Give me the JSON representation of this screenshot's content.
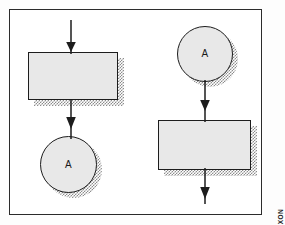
{
  "figure": {
    "type": "flowchart",
    "credit_label": "U2 DIXON",
    "frame": {
      "visible": true,
      "border_color": "#2b2b2b"
    },
    "style": {
      "shape_fill": "#e8e8e8",
      "shape_stroke": "#1d1d1d",
      "shadow_pattern": "halftone-dots",
      "shadow_color": "#8d8d8d",
      "background": "#ffffff"
    },
    "left_flow": {
      "name": "off-page-exit-fragment",
      "nodes": [
        {
          "kind": "process",
          "shape": "rectangle",
          "label": ""
        },
        {
          "kind": "connector",
          "shape": "circle",
          "label": "A"
        }
      ],
      "arrows": [
        {
          "from": "above",
          "to": "process",
          "direction": "down"
        },
        {
          "from": "process",
          "to": "connector",
          "direction": "down"
        }
      ]
    },
    "right_flow": {
      "name": "off-page-entry-fragment",
      "nodes": [
        {
          "kind": "connector",
          "shape": "circle",
          "label": "A"
        },
        {
          "kind": "process",
          "shape": "rectangle",
          "label": ""
        }
      ],
      "arrows": [
        {
          "from": "connector",
          "to": "process",
          "direction": "down"
        },
        {
          "from": "process",
          "to": "below",
          "direction": "down"
        }
      ]
    }
  }
}
